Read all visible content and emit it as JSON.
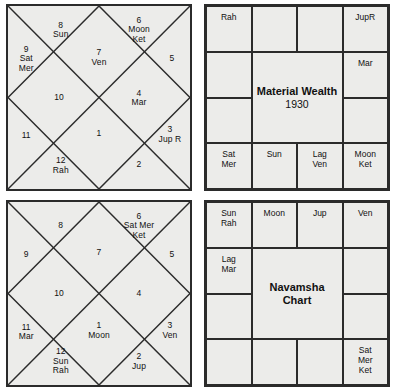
{
  "colors": {
    "background": "#ffffff",
    "panel_fill": "#ececea",
    "border": "#2b2b2b",
    "text": "#111111"
  },
  "charts": {
    "rasi_north": {
      "name": "Rasi Chart (North Indian style)",
      "style": "north-indian-diamond",
      "houses": [
        {
          "number": "1",
          "planets": ""
        },
        {
          "number": "2",
          "planets": ""
        },
        {
          "number": "3",
          "planets": "Jup R"
        },
        {
          "number": "4",
          "planets": "Mar"
        },
        {
          "number": "5",
          "planets": ""
        },
        {
          "number": "6",
          "planets": "Moon\nKet"
        },
        {
          "number": "7",
          "planets": "Ven"
        },
        {
          "number": "8",
          "planets": "Sun"
        },
        {
          "number": "9",
          "planets": "Sat\nMer"
        },
        {
          "number": "10",
          "planets": ""
        },
        {
          "number": "11",
          "planets": ""
        },
        {
          "number": "12",
          "planets": "Rah"
        }
      ]
    },
    "material_wealth_south": {
      "name": "Material Wealth chart (South Indian style)",
      "style": "south-indian-grid",
      "title_line1": "Material Wealth",
      "title_line2": "1930",
      "cells": [
        {
          "position": "top-row-1",
          "planets": "Rah"
        },
        {
          "position": "top-row-2",
          "planets": ""
        },
        {
          "position": "top-row-3",
          "planets": ""
        },
        {
          "position": "top-row-4",
          "planets": "JupR"
        },
        {
          "position": "right-col-2",
          "planets": "Mar"
        },
        {
          "position": "right-col-3",
          "planets": ""
        },
        {
          "position": "bottom-row-4",
          "planets": "Moon\nKet"
        },
        {
          "position": "bottom-row-3",
          "planets": "Lag\nVen"
        },
        {
          "position": "bottom-row-2",
          "planets": "Sun"
        },
        {
          "position": "bottom-row-1",
          "planets": "Sat\nMer"
        },
        {
          "position": "left-col-3",
          "planets": ""
        },
        {
          "position": "left-col-2",
          "planets": ""
        }
      ]
    },
    "navamsha_north": {
      "name": "Navamsha Rasi chart (North Indian style)",
      "style": "north-indian-diamond",
      "houses": [
        {
          "number": "1",
          "planets": "Moon"
        },
        {
          "number": "2",
          "planets": "Jup"
        },
        {
          "number": "3",
          "planets": "Ven"
        },
        {
          "number": "4",
          "planets": ""
        },
        {
          "number": "5",
          "planets": ""
        },
        {
          "number": "6",
          "planets": "Sat Mer\nKet"
        },
        {
          "number": "7",
          "planets": ""
        },
        {
          "number": "8",
          "planets": ""
        },
        {
          "number": "9",
          "planets": ""
        },
        {
          "number": "10",
          "planets": ""
        },
        {
          "number": "11",
          "planets": "Mar"
        },
        {
          "number": "12",
          "planets": "Sun\nRah"
        }
      ]
    },
    "navamsha_south": {
      "name": "Navamsha chart (South Indian style)",
      "style": "south-indian-grid",
      "title_line1": "Navamsha",
      "title_line2": "Chart",
      "cells": [
        {
          "position": "top-row-1",
          "planets": "Sun\nRah"
        },
        {
          "position": "top-row-2",
          "planets": "Moon"
        },
        {
          "position": "top-row-3",
          "planets": "Jup"
        },
        {
          "position": "top-row-4",
          "planets": "Ven"
        },
        {
          "position": "right-col-2",
          "planets": ""
        },
        {
          "position": "right-col-3",
          "planets": ""
        },
        {
          "position": "bottom-row-4",
          "planets": "Sat\nMer\nKet"
        },
        {
          "position": "bottom-row-3",
          "planets": ""
        },
        {
          "position": "bottom-row-2",
          "planets": ""
        },
        {
          "position": "bottom-row-1",
          "planets": ""
        },
        {
          "position": "left-col-3",
          "planets": ""
        },
        {
          "position": "left-col-2",
          "planets": "Lag\nMar"
        }
      ]
    }
  }
}
